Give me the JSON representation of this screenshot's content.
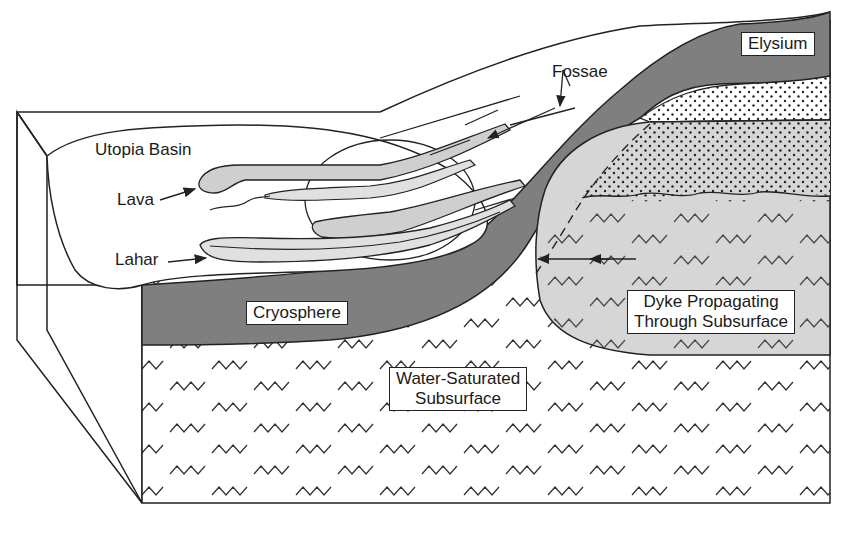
{
  "diagram": {
    "type": "geologic block diagram (cross-section)",
    "labels": {
      "utopia_basin": "Utopia Basin",
      "lava": "Lava",
      "lahar": "Lahar",
      "fossae": "Fossae",
      "elysium": "Elysium",
      "cryosphere": "Cryosphere",
      "water_saturated_line1": "Water-Saturated",
      "water_saturated_line2": "Subsurface",
      "dyke_line1": "Dyke Propagating",
      "dyke_line2": "Through Subsurface"
    },
    "colors": {
      "cryosphere": "#7f7f7f",
      "dyke": "#d6d6d6",
      "flow_fill": "#cfcfcf",
      "outline": "#222222",
      "background": "#ffffff"
    }
  }
}
